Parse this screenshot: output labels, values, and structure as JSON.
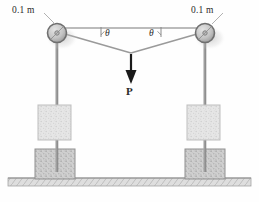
{
  "figure": {
    "type": "engineering-mechanics-diagram",
    "background_color": "#fefefe"
  },
  "labels": {
    "left_dimension": "0.1 m",
    "right_dimension": "0.1 m",
    "left_angle": "θ",
    "right_angle": "θ",
    "force": "P"
  },
  "colors": {
    "cable": "#9a9a9a",
    "post": "#8e8e8e",
    "pulley_fill": "#c9c9c9",
    "pulley_stroke": "#6f6f6f",
    "slider_block_fill": "#e2e2e2",
    "slider_block_stroke": "#b4b4b4",
    "base_block_fill": "#cfcfcf",
    "base_block_stroke": "#8f8f8f",
    "ground_fill": "#d8d8d8",
    "ground_stroke": "#9a9a9a",
    "arrow": "#1a1a1a",
    "text": "#2a2a2a",
    "leader": "#a0a0a0"
  },
  "geometry": {
    "left_pulley": {
      "cx": 57,
      "cy": 33,
      "r": 9.5,
      "hub_r": 2.2
    },
    "right_pulley": {
      "cx": 205,
      "cy": 33,
      "r": 9.5,
      "hub_r": 2.2
    },
    "reference_line": {
      "x1": 57,
      "y1": 28,
      "x2": 205,
      "y2": 28
    },
    "cable_junction": {
      "x": 131,
      "y": 53
    },
    "left_post": {
      "x": 57,
      "y_top": 42,
      "y_bottom": 172
    },
    "right_post": {
      "x": 205,
      "y_top": 42,
      "y_bottom": 172
    },
    "left_slider_block": {
      "x": 38,
      "y": 105,
      "w": 33,
      "h": 35
    },
    "right_slider_block": {
      "x": 187,
      "y": 105,
      "w": 33,
      "h": 35
    },
    "left_base_block": {
      "x": 35,
      "y": 149,
      "w": 40,
      "h": 30
    },
    "right_base_block": {
      "x": 185,
      "y": 149,
      "w": 40,
      "h": 30
    },
    "ground": {
      "x": 8,
      "y": 178,
      "w": 243,
      "h": 8
    },
    "force_arrow": {
      "x": 131,
      "y_top": 57,
      "y_bottom": 82
    }
  },
  "label_positions": {
    "left_dimension": {
      "x": 12,
      "y": 10
    },
    "right_dimension": {
      "x": 191,
      "y": 10
    },
    "left_angle": {
      "x": 104,
      "y": 29
    },
    "right_angle": {
      "x": 150,
      "y": 29
    },
    "force": {
      "x": 126,
      "y": 86
    }
  }
}
